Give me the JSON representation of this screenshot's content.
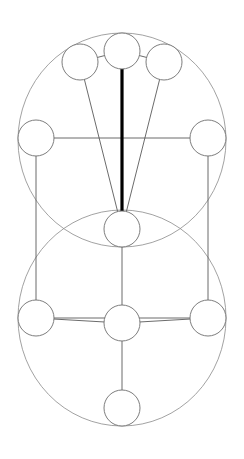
{
  "diagram": {
    "type": "node-link-diagram",
    "canvas": {
      "width": 244,
      "height": 459
    },
    "colors": {
      "background": "#ffffff",
      "node_fill": "#ffffff",
      "node_stroke": "#6e6e6e",
      "path_stroke": "#5a5a5a",
      "ellipse_stroke": "#8a8a8a",
      "highlight_stroke": "#000000"
    },
    "stroke_widths": {
      "node": 0.9,
      "path": 0.9,
      "ellipse": 0.8,
      "highlight": 3.2
    },
    "node_radius": 18,
    "nodes": [
      {
        "id": "n1",
        "name": "top-center-node",
        "label": "",
        "cx": 122,
        "cy": 51,
        "r": 18
      },
      {
        "id": "n2",
        "name": "top-left-node",
        "label": "",
        "cx": 80,
        "cy": 62,
        "r": 18
      },
      {
        "id": "n3",
        "name": "top-right-node",
        "label": "",
        "cx": 164,
        "cy": 62,
        "r": 18
      },
      {
        "id": "n4",
        "name": "middle-left-node",
        "label": "",
        "cx": 36,
        "cy": 138,
        "r": 18
      },
      {
        "id": "n5",
        "name": "middle-right-node",
        "label": "",
        "cx": 208,
        "cy": 138,
        "r": 18
      },
      {
        "id": "n6",
        "name": "center-node",
        "label": "",
        "cx": 122,
        "cy": 229,
        "r": 18
      },
      {
        "id": "n7",
        "name": "lower-left-node",
        "label": "",
        "cx": 36,
        "cy": 318,
        "r": 18
      },
      {
        "id": "n8",
        "name": "lower-right-node",
        "label": "",
        "cx": 208,
        "cy": 318,
        "r": 18
      },
      {
        "id": "n9",
        "name": "lower-center-node",
        "label": "",
        "cx": 122,
        "cy": 323,
        "r": 18
      },
      {
        "id": "n10",
        "name": "bottom-node",
        "label": "",
        "cx": 122,
        "cy": 408,
        "r": 18
      }
    ],
    "ellipses": [
      {
        "name": "upper-great-circle",
        "cx": 122,
        "cy": 140,
        "rx": 104,
        "ry": 107
      },
      {
        "name": "lower-great-circle",
        "cx": 122,
        "cy": 318,
        "rx": 104,
        "ry": 108
      }
    ],
    "paths": [
      {
        "name": "path-top-left-to-top-center",
        "from": "n2",
        "to": "n1",
        "highlight": false
      },
      {
        "name": "path-top-center-to-top-right",
        "from": "n1",
        "to": "n3",
        "highlight": false
      },
      {
        "name": "path-top-left-to-center",
        "from": "n2",
        "to": "n6",
        "highlight": false
      },
      {
        "name": "path-top-right-to-center",
        "from": "n3",
        "to": "n6",
        "highlight": false
      },
      {
        "name": "path-top-center-to-center",
        "from": "n1",
        "to": "n6",
        "highlight": true
      },
      {
        "name": "path-middle-left-to-middle-right",
        "from": "n4",
        "to": "n5",
        "highlight": false
      },
      {
        "name": "path-middle-left-to-lower-left",
        "from": "n4",
        "to": "n7",
        "highlight": false
      },
      {
        "name": "path-middle-right-to-lower-right",
        "from": "n5",
        "to": "n8",
        "highlight": false
      },
      {
        "name": "path-center-to-lower-center",
        "from": "n6",
        "to": "n9",
        "highlight": false
      },
      {
        "name": "path-lower-left-to-lower-right",
        "from": "n7",
        "to": "n8",
        "highlight": false
      },
      {
        "name": "path-lower-left-to-lower-center",
        "from": "n7",
        "to": "n9",
        "highlight": false
      },
      {
        "name": "path-lower-right-to-lower-center",
        "from": "n8",
        "to": "n9",
        "highlight": false
      },
      {
        "name": "path-lower-center-to-bottom",
        "from": "n9",
        "to": "n10",
        "highlight": false
      }
    ]
  }
}
